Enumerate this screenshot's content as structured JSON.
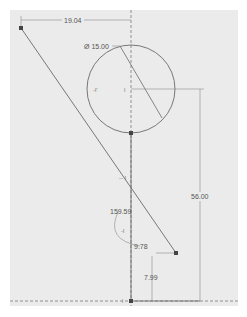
{
  "sketch": {
    "background_color": "#ebebeb",
    "line_color": "#6a6a6a",
    "dim_color": "#8a8a8a",
    "point_color": "#444444",
    "dimensions": {
      "top_horizontal": "19.04",
      "circle_diameter": "Ø 15.00",
      "right_vertical": "56.00",
      "angle": "159.59",
      "small_angle_ref": "9.78",
      "bottom_vertical": "7.99"
    }
  }
}
